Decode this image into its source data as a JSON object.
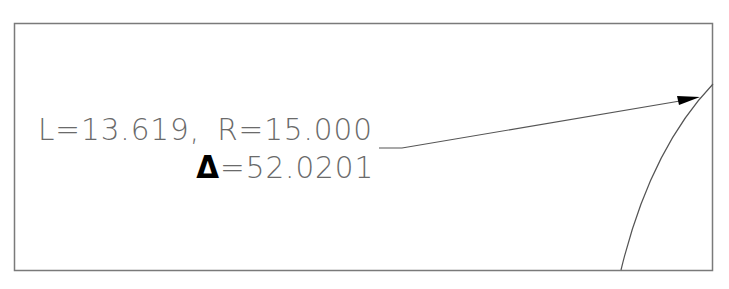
{
  "drawing": {
    "annotation": {
      "length_label": "L=13.619,",
      "radius_label": "R=15.000",
      "delta_symbol": "Δ",
      "delta_value": "=52.0201"
    },
    "values": {
      "arc_length": "13.619",
      "radius": "15.000",
      "central_angle": "52.0201"
    },
    "colors": {
      "frame": "#7a7a7a",
      "text": "#6a6a6a",
      "leader": "#555555",
      "arrowhead": "#000000",
      "delta": "#000000",
      "background": "#ffffff"
    }
  }
}
